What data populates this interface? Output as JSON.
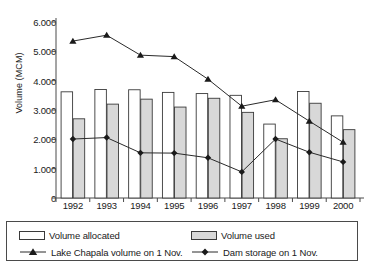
{
  "chart_data": {
    "type": "bar",
    "title": "",
    "xlabel": "",
    "ylabel": "Volume (MCM)",
    "categories": [
      "1992",
      "1993",
      "1994",
      "1995",
      "1996",
      "1997",
      "1998",
      "1999",
      "2000"
    ],
    "ylim": [
      0,
      6000
    ],
    "ytick_values": [
      0,
      1000,
      2000,
      3000,
      4000,
      5000,
      6000
    ],
    "ytick_labels": [
      "0",
      "1.000",
      "2.000",
      "3.000",
      "4.000",
      "5.000",
      "6.000"
    ],
    "grid": false,
    "legend_position": "bottom",
    "series": [
      {
        "name": "Volume allocated",
        "render": "bar",
        "fill": "#ffffff",
        "stroke": "#3a3a3a",
        "values": [
          3620,
          3700,
          3690,
          3600,
          3560,
          3500,
          2520,
          3630,
          2800
        ]
      },
      {
        "name": "Volume used",
        "render": "bar",
        "fill": "#d8d8d8",
        "stroke": "#3a3a3a",
        "values": [
          2700,
          3200,
          3370,
          3100,
          3400,
          2920,
          2020,
          3230,
          2330
        ]
      },
      {
        "name": "Lake Chapala volume on 1 Nov.",
        "render": "line",
        "marker": "triangle",
        "stroke": "#2a2a2a",
        "values": [
          5350,
          5550,
          4870,
          4820,
          4050,
          3130,
          3350,
          2620,
          1900
        ]
      },
      {
        "name": "Dam storage on 1 Nov.",
        "render": "line",
        "marker": "diamond",
        "stroke": "#2a2a2a",
        "values": [
          2010,
          2060,
          1540,
          1530,
          1370,
          890,
          2010,
          1560,
          1230
        ]
      }
    ]
  }
}
